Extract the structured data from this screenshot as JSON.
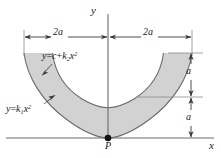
{
  "figure": {
    "background_color": "#ffffff",
    "line_color": "#3a3a3a",
    "fill_color": "#d2d2d2"
  },
  "axes": {
    "y_label": "y",
    "x_label": "x",
    "origin_x_px": 108,
    "x_axis_y_px": 138
  },
  "curves": [
    {
      "name": "outer-parabola",
      "equation_label": "y = c + k",
      "equation_sub": "2",
      "equation_tail": "x",
      "equation_sup": "2",
      "equation_full": "y = c + k2x^2"
    },
    {
      "name": "inner-parabola",
      "equation_label": "y = k",
      "equation_sub": "1",
      "equation_tail": "x",
      "equation_sup": "2",
      "equation_full": "y = k1x^2"
    }
  ],
  "dimensions": {
    "horizontal_left": "2a",
    "horizontal_right": "2a",
    "vertical_top": "a",
    "vertical_bottom": "a"
  },
  "points": [
    {
      "name": "point-p",
      "label": "P",
      "x_px": 108,
      "y_px": 138
    }
  ],
  "equation_outer": {
    "lhs": "y",
    "eq": "=",
    "c": "c",
    "plus": "+",
    "k": "k",
    "k_sub": "2",
    "x": "x",
    "x_sup": "2"
  },
  "equation_inner": {
    "lhs": "y",
    "eq": "=",
    "k": "k",
    "k_sub": "1",
    "x": "x",
    "x_sup": "2"
  }
}
